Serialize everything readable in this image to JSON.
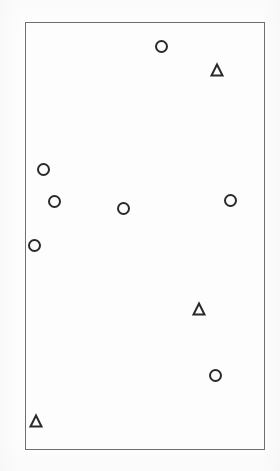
{
  "figure": {
    "width": 280,
    "height": 471,
    "background_color": "#fdfdfd"
  },
  "plot_frame": {
    "x": 25,
    "y": 22,
    "width": 240,
    "height": 428,
    "border_color": "#6f6f6f",
    "border_width": 1,
    "fill": "none"
  },
  "chart_data": {
    "type": "scatter",
    "title": "",
    "subtitle": "",
    "xlabel": "",
    "ylabel": "",
    "xlim": [
      0,
      1
    ],
    "ylim": [
      0,
      1
    ],
    "xticks": [],
    "yticks": [],
    "xticklabels": [],
    "yticklabels": [],
    "grid": false,
    "legend": false,
    "legend_position": "none",
    "annotations": [],
    "marker_styles": {
      "circle": {
        "shape": "circle",
        "fill": "none",
        "edge_color": "#2a2a2a",
        "edge_width": 2,
        "size_px": 13
      },
      "triangle": {
        "shape": "triangle-up",
        "fill": "none",
        "edge_color": "#2a2a2a",
        "edge_width": 2,
        "size_px": 14
      }
    },
    "series": [
      {
        "name": "circle",
        "marker": "circle",
        "count": 8,
        "points": [
          {
            "label": "c1",
            "px": 161,
            "py": 46,
            "x": 0.567,
            "y": 0.944
          },
          {
            "label": "c2",
            "px": 43,
            "py": 169,
            "x": 0.075,
            "y": 0.657
          },
          {
            "label": "c3",
            "px": 54,
            "py": 201,
            "x": 0.121,
            "y": 0.582
          },
          {
            "label": "c4",
            "px": 123,
            "py": 208,
            "x": 0.408,
            "y": 0.565
          },
          {
            "label": "c5",
            "px": 230,
            "py": 200,
            "x": 0.854,
            "y": 0.584
          },
          {
            "label": "c6",
            "px": 34,
            "py": 245,
            "x": 0.038,
            "y": 0.479
          },
          {
            "label": "c7",
            "px": 215,
            "py": 375,
            "x": 0.792,
            "y": 0.175
          }
        ]
      },
      {
        "name": "triangle",
        "marker": "triangle-up",
        "count": 3,
        "points": [
          {
            "label": "t1",
            "px": 217,
            "py": 70,
            "x": 0.8,
            "y": 0.888
          },
          {
            "label": "t2",
            "px": 199,
            "py": 309,
            "x": 0.725,
            "y": 0.329
          },
          {
            "label": "t3",
            "px": 36,
            "py": 421,
            "x": 0.046,
            "y": 0.068
          }
        ]
      }
    ]
  }
}
